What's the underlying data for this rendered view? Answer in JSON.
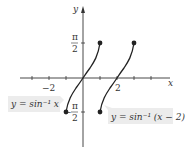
{
  "diagram": {
    "axes": {
      "x_label": "x",
      "y_label": "y",
      "x_ticks": [
        {
          "value": -2,
          "label": "−2"
        },
        {
          "value": 2,
          "label": "2"
        }
      ],
      "y_ticks": [
        {
          "value": "pi/2",
          "label_num": "π",
          "label_den": "2",
          "sign": ""
        },
        {
          "value": "-pi/2",
          "label_num": "π",
          "label_den": "2",
          "sign": "−"
        }
      ]
    },
    "curves": [
      {
        "name": "arcsin-x",
        "label": "y = sin⁻¹ x",
        "domain": [
          -1,
          1
        ],
        "range": [
          "-π/2",
          "π/2"
        ]
      },
      {
        "name": "arcsin-x-minus-2",
        "label": "y = sin⁻¹ (x − 2)",
        "domain": [
          1,
          3
        ],
        "range": [
          "-π/2",
          "π/2"
        ]
      }
    ],
    "colors": {
      "axis": "#333333",
      "curve": "#222222",
      "label_box": "#ececec"
    }
  }
}
